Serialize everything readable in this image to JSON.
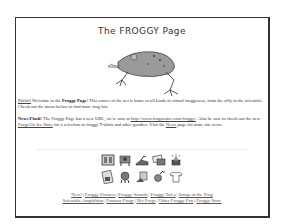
{
  "page": {
    "title": "The FROGGY Page",
    "frog_caption": "Ribbit"
  },
  "intro": {
    "ribbit_link": "Ribbit!",
    "text_before_bold": " Welcome to the ",
    "bold": "Froggy Page",
    "text_after_bold": "! This corner of the net is home to all kinds of virtual froggeness, from the silly to the scientific. Check out the menu below to find more frog fun."
  },
  "news": {
    "label": "News Flash!",
    "text1": " The Froggy Page has a new URL, we're now at ",
    "url_link": "http://www.frogsonice.com/froggy/",
    "text2": ". Also be sure to check out the new ",
    "store_link": "Frogs On Ice Store",
    "text3": " for a selection of froggy T-shirts and other goodies. Visit the ",
    "news_link": "News",
    "text4": " page for more site news."
  },
  "icons": {
    "row1": [
      "pictures-icon",
      "sounds-icon",
      "tales-icon",
      "songs-icon",
      "scientific-icon"
    ],
    "row2": [
      "famous-frogs-icon",
      "net-frogs-icon",
      "other-fun-icon",
      "news-icon",
      "store-tshirt-icon"
    ]
  },
  "nav": {
    "line1": [
      "New!",
      "Froggy Pictures",
      "Froggy Sounds",
      "Froggy Tales",
      "Songs of the Frog"
    ],
    "line2": [
      "Scientific Amphibian",
      "Famous Frogs",
      "Net Frogs",
      "Other Froggy Fun",
      "Froggy Store"
    ],
    "separator": "|"
  }
}
